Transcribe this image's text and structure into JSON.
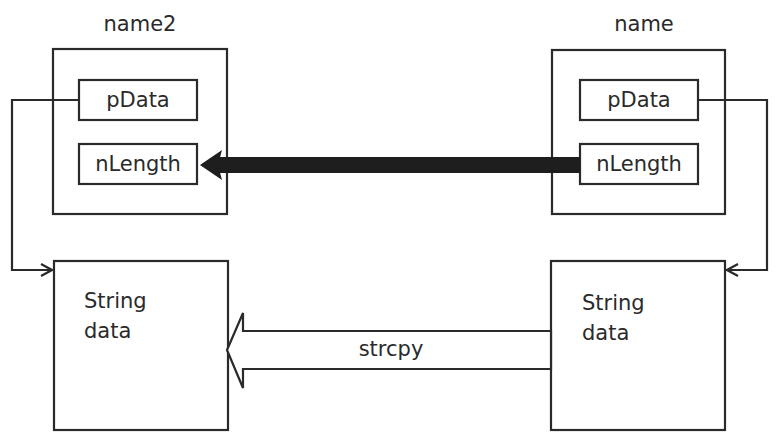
{
  "diagram": {
    "objects": [
      {
        "id": "name2",
        "label": "name2",
        "fields": {
          "pData": "pData",
          "nLength": "nLength"
        }
      },
      {
        "id": "name",
        "label": "name",
        "fields": {
          "pData": "pData",
          "nLength": "nLength"
        }
      }
    ],
    "buffers": [
      {
        "owner": "name2",
        "line1": "String",
        "line2": "data"
      },
      {
        "owner": "name",
        "line1": "String",
        "line2": "data"
      }
    ],
    "arrows": {
      "length_copy": {
        "from": "name.nLength",
        "to": "name2.nLength",
        "style": "thick-solid"
      },
      "strcpy": {
        "label": "strcpy",
        "from": "name.buffer",
        "to": "name2.buffer",
        "style": "hollow-block"
      },
      "name2_pointer": {
        "from": "name2.pData",
        "to": "name2.buffer"
      },
      "name_pointer": {
        "from": "name.pData",
        "to": "name.buffer"
      }
    },
    "colors": {
      "stroke": "#2a2a2a",
      "background": "#ffffff"
    }
  }
}
